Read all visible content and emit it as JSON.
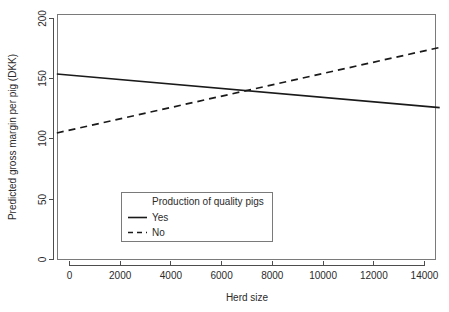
{
  "chart_data": {
    "type": "line",
    "title": "",
    "subtitle": "",
    "xlabel": "Herd size",
    "ylabel": "Predicted gross margin per pig (DKK)",
    "xlim": [
      -600,
      14800
    ],
    "ylim": [
      0,
      205
    ],
    "xticks": [
      0,
      2000,
      4000,
      6000,
      8000,
      10000,
      12000,
      14000
    ],
    "xticklabels": [
      "0",
      "2000",
      "4000",
      "6000",
      "8000",
      "10000",
      "12000",
      "14000"
    ],
    "yticks": [
      0,
      50,
      100,
      150,
      200
    ],
    "yticklabels": [
      "0",
      "50",
      "100",
      "150",
      "200"
    ],
    "grid": false,
    "legend_position": "center-bottom-inside",
    "legend_title": "Production of quality pigs",
    "series": [
      {
        "name": "Yes",
        "style": "solid",
        "color": "#1a1a1a",
        "x": [
          -500,
          14600
        ],
        "y": [
          154,
          126
        ]
      },
      {
        "name": "No",
        "style": "dashed",
        "color": "#1a1a1a",
        "x": [
          -500,
          14600
        ],
        "y": [
          105,
          176
        ]
      }
    ],
    "annotations": []
  },
  "legend": {
    "title": "Production of quality pigs",
    "entries": [
      {
        "label": "Yes",
        "style": "solid"
      },
      {
        "label": "No",
        "style": "dashed"
      }
    ]
  },
  "axes": {
    "x_title": "Herd size",
    "y_title": "Predicted gross margin per pig (DKK)",
    "x_tick_labels": [
      "0",
      "2000",
      "4000",
      "6000",
      "8000",
      "10000",
      "12000",
      "14000"
    ],
    "y_tick_labels": [
      "0",
      "50",
      "100",
      "150",
      "200"
    ]
  }
}
